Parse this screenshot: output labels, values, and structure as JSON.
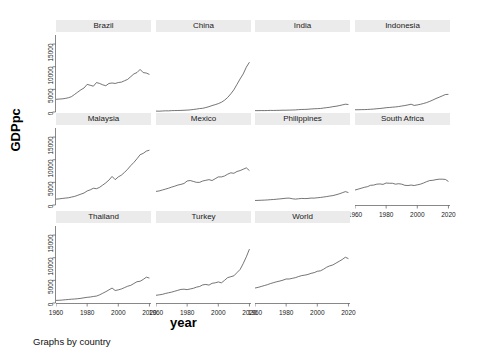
{
  "chart_data": {
    "type": "line",
    "title": "",
    "subtitle": "",
    "caption": "Graphs by country",
    "xlabel": "year",
    "ylabel": "GDPpc",
    "xlim": [
      1960,
      2021
    ],
    "ylim": [
      0,
      17000
    ],
    "xticks": [
      1960,
      1980,
      2000,
      2020
    ],
    "xtick_labels": [
      "1960",
      "1980",
      "2000",
      "2020"
    ],
    "yticks": [
      0,
      5000,
      10000,
      15000
    ],
    "ytick_labels": [
      "0",
      "5000",
      "10000",
      "15000"
    ],
    "grid": false,
    "legend": "none",
    "layout": {
      "rows": 3,
      "cols": 4,
      "panels_used": 11
    },
    "panel_titles": [
      "Brazil",
      "China",
      "India",
      "Indonesia",
      "Malaysia",
      "Mexico",
      "Philippines",
      "South Africa",
      "Thailand",
      "Turkey",
      "World"
    ],
    "line_color": "#3a3a3a",
    "strip_color": "#ebebeb",
    "background_color": "#ffffff",
    "series": [
      {
        "name": "Brazil",
        "x": [
          1960,
          1962,
          1964,
          1966,
          1968,
          1970,
          1972,
          1974,
          1976,
          1978,
          1980,
          1982,
          1984,
          1986,
          1988,
          1990,
          1992,
          1994,
          1996,
          1998,
          2000,
          2002,
          2004,
          2006,
          2008,
          2010,
          2012,
          2014,
          2016,
          2018,
          2020
        ],
        "values": [
          2800,
          2850,
          2900,
          3000,
          3150,
          3400,
          3900,
          4400,
          4900,
          5300,
          6100,
          5900,
          5700,
          6500,
          6300,
          6000,
          5800,
          6300,
          6400,
          6300,
          6500,
          6600,
          6900,
          7200,
          7800,
          8400,
          8700,
          9400,
          8700,
          8600,
          8300
        ]
      },
      {
        "name": "China",
        "x": [
          1960,
          1962,
          1964,
          1966,
          1968,
          1970,
          1972,
          1974,
          1976,
          1978,
          1980,
          1982,
          1984,
          1986,
          1988,
          1990,
          1992,
          1994,
          1996,
          1998,
          2000,
          2002,
          2004,
          2006,
          2008,
          2010,
          2012,
          2014,
          2016,
          2018,
          2020
        ],
        "values": [
          200,
          180,
          220,
          260,
          250,
          300,
          320,
          330,
          350,
          380,
          420,
          470,
          560,
          640,
          760,
          820,
          980,
          1180,
          1420,
          1620,
          1850,
          2150,
          2600,
          3200,
          4000,
          4900,
          6100,
          7300,
          8400,
          9900,
          11000
        ]
      },
      {
        "name": "India",
        "x": [
          1960,
          1962,
          1964,
          1966,
          1968,
          1970,
          1972,
          1974,
          1976,
          1978,
          1980,
          1982,
          1984,
          1986,
          1988,
          1990,
          1992,
          1994,
          1996,
          1998,
          2000,
          2002,
          2004,
          2006,
          2008,
          2010,
          2012,
          2014,
          2016,
          2018,
          2020
        ],
        "values": [
          300,
          300,
          320,
          310,
          330,
          350,
          340,
          360,
          370,
          400,
          400,
          420,
          440,
          460,
          520,
          560,
          570,
          610,
          670,
          710,
          740,
          780,
          870,
          960,
          1040,
          1180,
          1270,
          1400,
          1560,
          1720,
          1650
        ]
      },
      {
        "name": "Indonesia",
        "x": [
          1960,
          1962,
          1964,
          1966,
          1968,
          1970,
          1972,
          1974,
          1976,
          1978,
          1980,
          1982,
          1984,
          1986,
          1988,
          1990,
          1992,
          1994,
          1996,
          1998,
          2000,
          2002,
          2004,
          2006,
          2008,
          2010,
          2012,
          2014,
          2016,
          2018,
          2020
        ],
        "values": [
          500,
          500,
          520,
          530,
          560,
          600,
          650,
          720,
          780,
          850,
          950,
          1000,
          1060,
          1120,
          1200,
          1320,
          1430,
          1560,
          1720,
          1450,
          1560,
          1700,
          1880,
          2080,
          2350,
          2650,
          2980,
          3250,
          3550,
          3850,
          3900
        ]
      },
      {
        "name": "Malaysia",
        "x": [
          1960,
          1962,
          1964,
          1966,
          1968,
          1970,
          1972,
          1974,
          1976,
          1978,
          1980,
          1982,
          1984,
          1986,
          1988,
          1990,
          1992,
          1994,
          1996,
          1998,
          2000,
          2002,
          2004,
          2006,
          2008,
          2010,
          2012,
          2014,
          2016,
          2018,
          2020
        ],
        "values": [
          1300,
          1350,
          1450,
          1520,
          1600,
          1750,
          1900,
          2150,
          2400,
          2650,
          3100,
          3350,
          3700,
          3600,
          3900,
          4400,
          4900,
          5500,
          6300,
          5600,
          6200,
          6600,
          7200,
          7900,
          8700,
          9400,
          10200,
          11100,
          11400,
          11900,
          12100
        ]
      },
      {
        "name": "Mexico",
        "x": [
          1960,
          1962,
          1964,
          1966,
          1968,
          1970,
          1972,
          1974,
          1976,
          1978,
          1980,
          1982,
          1984,
          1986,
          1988,
          1990,
          1992,
          1994,
          1996,
          1998,
          2000,
          2002,
          2004,
          2006,
          2008,
          2010,
          2012,
          2014,
          2016,
          2018,
          2020
        ],
        "values": [
          3000,
          3100,
          3300,
          3500,
          3700,
          3950,
          4150,
          4400,
          4550,
          4750,
          5300,
          5400,
          5200,
          5000,
          5000,
          5300,
          5450,
          5600,
          5400,
          5800,
          6200,
          6200,
          6400,
          6800,
          7100,
          7000,
          7400,
          7600,
          7900,
          8200,
          7600
        ]
      },
      {
        "name": "Philippines",
        "x": [
          1960,
          1962,
          1964,
          1966,
          1968,
          1970,
          1972,
          1974,
          1976,
          1978,
          1980,
          1982,
          1984,
          1986,
          1988,
          1990,
          1992,
          1994,
          1996,
          1998,
          2000,
          2002,
          2004,
          2006,
          2008,
          2010,
          2012,
          2014,
          2016,
          2018,
          2020
        ],
        "values": [
          1000,
          1020,
          1050,
          1080,
          1120,
          1180,
          1220,
          1280,
          1350,
          1420,
          1500,
          1520,
          1380,
          1300,
          1380,
          1450,
          1420,
          1450,
          1530,
          1520,
          1600,
          1660,
          1760,
          1860,
          1980,
          2080,
          2250,
          2450,
          2700,
          2950,
          2750
        ]
      },
      {
        "name": "South Africa",
        "x": [
          1960,
          1962,
          1964,
          1966,
          1968,
          1970,
          1972,
          1974,
          1976,
          1978,
          1980,
          1982,
          1984,
          1986,
          1988,
          1990,
          1992,
          1994,
          1996,
          1998,
          2000,
          2002,
          2004,
          2006,
          2008,
          2010,
          2012,
          2014,
          2016,
          2018,
          2020
        ],
        "values": [
          3300,
          3500,
          3700,
          3900,
          4050,
          4350,
          4400,
          4600,
          4650,
          4550,
          4850,
          4800,
          4800,
          4600,
          4700,
          4600,
          4350,
          4300,
          4400,
          4300,
          4450,
          4600,
          4850,
          5150,
          5400,
          5450,
          5600,
          5700,
          5700,
          5650,
          5200
        ]
      },
      {
        "name": "Thailand",
        "x": [
          1960,
          1962,
          1964,
          1966,
          1968,
          1970,
          1972,
          1974,
          1976,
          1978,
          1980,
          1982,
          1984,
          1986,
          1988,
          1990,
          1992,
          1994,
          1996,
          1998,
          2000,
          2002,
          2004,
          2006,
          2008,
          2010,
          2012,
          2014,
          2016,
          2018,
          2020
        ],
        "values": [
          570,
          600,
          650,
          720,
          780,
          840,
          880,
          950,
          1030,
          1150,
          1250,
          1320,
          1440,
          1530,
          1800,
          2150,
          2500,
          2900,
          3300,
          2750,
          2900,
          3100,
          3400,
          3700,
          3900,
          4300,
          4700,
          4800,
          5200,
          5700,
          5500
        ]
      },
      {
        "name": "Turkey",
        "x": [
          1960,
          1962,
          1964,
          1966,
          1968,
          1970,
          1972,
          1974,
          1976,
          1978,
          1980,
          1982,
          1984,
          1986,
          1988,
          1990,
          1992,
          1994,
          1996,
          1998,
          2000,
          2002,
          2004,
          2006,
          2008,
          2010,
          2012,
          2014,
          2016,
          2018,
          2020
        ],
        "values": [
          1700,
          1800,
          1900,
          2100,
          2250,
          2400,
          2600,
          2800,
          3000,
          3050,
          2950,
          3100,
          3250,
          3500,
          3650,
          4000,
          4100,
          3950,
          4350,
          4450,
          4650,
          4450,
          5000,
          5600,
          5800,
          6000,
          6700,
          7400,
          8700,
          10200,
          11900
        ]
      },
      {
        "name": "World",
        "x": [
          1960,
          1962,
          1964,
          1966,
          1968,
          1970,
          1972,
          1974,
          1976,
          1978,
          1980,
          1982,
          1984,
          1986,
          1988,
          1990,
          1992,
          1994,
          1996,
          1998,
          2000,
          2002,
          2004,
          2006,
          2008,
          2010,
          2012,
          2014,
          2016,
          2018,
          2020
        ],
        "values": [
          3300,
          3450,
          3650,
          3850,
          4050,
          4300,
          4500,
          4700,
          4850,
          5050,
          5300,
          5300,
          5450,
          5600,
          5850,
          6050,
          6150,
          6300,
          6550,
          6700,
          7000,
          7100,
          7450,
          7900,
          8200,
          8400,
          8800,
          9200,
          9600,
          10100,
          9800
        ]
      }
    ]
  }
}
